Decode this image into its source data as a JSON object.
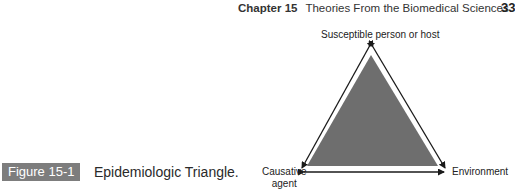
{
  "header": {
    "chapter": "Chapter 15",
    "title": "Theories From the Biomedical Sciences",
    "page_number": "33"
  },
  "figure": {
    "label": "Figure 15-1",
    "title": "Epidemiologic Triangle.",
    "vertices": {
      "top": "Susceptible person or host",
      "bottom_left_line1": "Causative",
      "bottom_left_line2": "agent",
      "bottom_right": "Environment"
    },
    "colors": {
      "fill": "#6e6e6e",
      "label_bg": "#7d7d7d",
      "arrows": "#1a1a1a"
    }
  }
}
